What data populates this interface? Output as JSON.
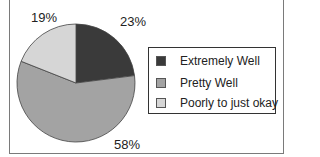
{
  "chart_data": {
    "type": "pie",
    "title": "",
    "categories": [
      "Extremely Well",
      "Pretty Well",
      "Poorly to just okay"
    ],
    "values": [
      23,
      58,
      19
    ],
    "labels": [
      "23%",
      "58%",
      "19%"
    ],
    "colors": [
      "#3a3a3a",
      "#a3a3a3",
      "#d6d6d6"
    ],
    "start_angle_deg": 0,
    "direction": "clockwise_from_top",
    "legend_position": "right"
  },
  "legend": {
    "items": [
      {
        "label": "Extremely Well",
        "color": "#3a3a3a"
      },
      {
        "label": "Pretty Well",
        "color": "#a3a3a3"
      },
      {
        "label": "Poorly to just okay",
        "color": "#d6d6d6"
      }
    ]
  }
}
